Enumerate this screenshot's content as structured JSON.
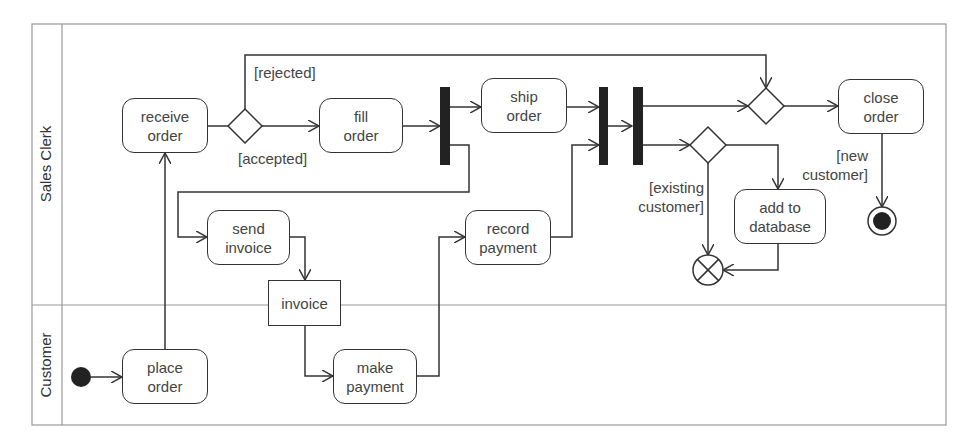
{
  "swimlanes": [
    {
      "name": "Sales Clerk"
    },
    {
      "name": "Customer"
    }
  ],
  "actions": {
    "receive_order": "receive\norder",
    "fill_order": "fill\norder",
    "ship_order": "ship\norder",
    "close_order": "close\norder",
    "send_invoice": "send\ninvoice",
    "record_payment": "record\npayment",
    "add_to_database": "add to\ndatabase",
    "place_order": "place\norder",
    "make_payment": "make\npayment"
  },
  "objects": {
    "invoice": "invoice"
  },
  "guards": {
    "rejected": "[rejected]",
    "accepted": "[accepted]",
    "existing_customer": "[existing\ncustomer]",
    "new_customer": "[new\ncustomer]"
  },
  "colors": {
    "line": "#333333",
    "frame": "#999999",
    "node_fill": "#222222"
  }
}
